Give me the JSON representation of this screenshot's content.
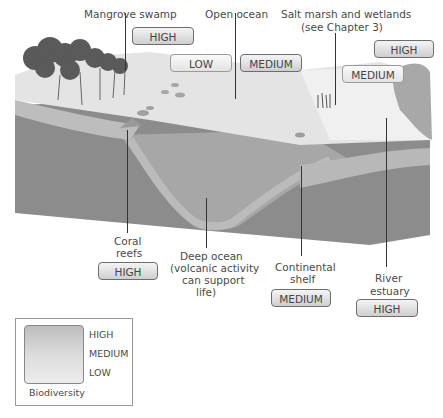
{
  "diagram": {
    "type": "cross-section illustration"
  },
  "habitats": [
    {
      "id": "mangrove",
      "label": "Mangrove swamp",
      "level": "HIGH"
    },
    {
      "id": "open-ocean",
      "label": "Open ocean",
      "level_low": "LOW",
      "level_medium": "MEDIUM"
    },
    {
      "id": "salt-marsh",
      "label_line1": "Salt marsh and wetlands",
      "label_line2": "(see Chapter 3)",
      "level_high": "HIGH",
      "level_medium": "MEDIUM"
    },
    {
      "id": "coral",
      "label_line1": "Coral",
      "label_line2": "reefs",
      "level": "HIGH"
    },
    {
      "id": "deep-ocean",
      "label_line1": "Deep ocean",
      "label_line2": "(volcanic activity",
      "label_line3": "can support",
      "label_line4": "life)"
    },
    {
      "id": "continental-shelf",
      "label_line1": "Continental",
      "label_line2": "shelf",
      "level": "MEDIUM"
    },
    {
      "id": "river-estuary",
      "label_line1": "River",
      "label_line2": "estuary",
      "level": "HIGH"
    }
  ],
  "legend": {
    "title": "Biodiversity",
    "levels": [
      "HIGH",
      "MEDIUM",
      "LOW"
    ]
  },
  "colors": {
    "surface": "#e2e2e2",
    "deep_water": "#8a8a8a",
    "shelf_band": "#b4b4b4",
    "badge_border": "#6d6d6d"
  }
}
